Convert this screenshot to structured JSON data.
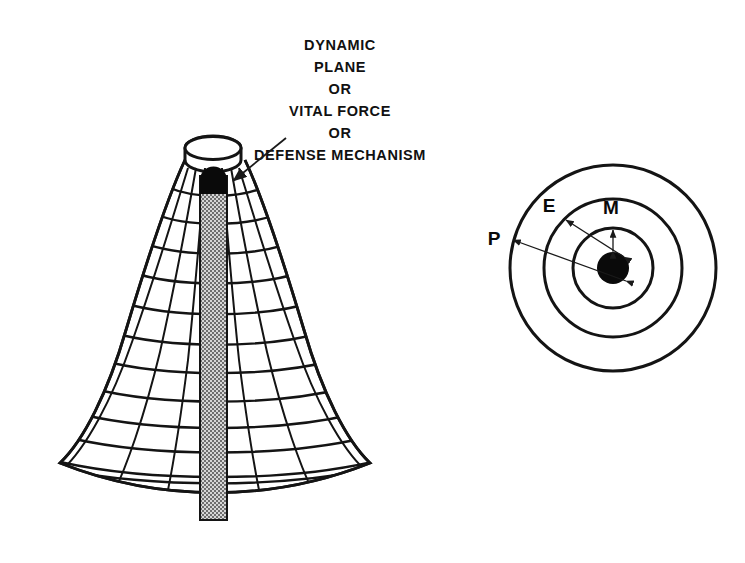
{
  "figure": {
    "title_block": {
      "name": "annotation-caption",
      "lines": [
        "DYNAMIC",
        "PLANE",
        "OR",
        "VITAL FORCE",
        "OR",
        "DEFENSE  MECHANISM"
      ]
    },
    "cone_diagram": {
      "name": "cone-mesh-diagram",
      "description": "Wireframe cone with open elliptical top rim, horizontal rings, radial meridians and a shaded central core column capped in black",
      "ring_count": 13,
      "radial_count": 9,
      "core_column": {
        "label": "central-core-column",
        "fill_pattern": "stipple-checker",
        "cap": "black-rounded-cap"
      }
    },
    "circles_diagram": {
      "name": "concentric-circles-diagram",
      "description": "Three concentric circles with filled black center and double-headed radius arrows",
      "labels": [
        {
          "key": "P",
          "text": "P",
          "target": "outer-circle"
        },
        {
          "key": "E",
          "text": "E",
          "target": "middle-circle"
        },
        {
          "key": "M",
          "text": "M",
          "target": "inner-circle"
        }
      ],
      "center_marker": "filled-black-disc"
    },
    "colors": {
      "ink": "#141414",
      "background": "#ffffff",
      "core_fill": "#b9b9b9",
      "solid_black": "#0a0a0a"
    }
  }
}
